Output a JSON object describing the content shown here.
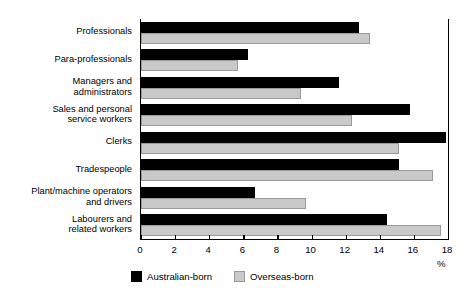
{
  "chart_data": {
    "type": "bar",
    "orientation": "horizontal",
    "title": "",
    "xlabel": "%",
    "ylabel": "",
    "xlim": [
      0,
      18
    ],
    "xticks": [
      0,
      2,
      4,
      6,
      8,
      10,
      12,
      14,
      16,
      18
    ],
    "grid": false,
    "legend_position": "bottom-center",
    "categories": [
      "Professionals",
      "Para-professionals",
      "Managers and\nadministrators",
      "Sales and personal\nservice workers",
      "Clerks",
      "Tradespeople",
      "Plant/machine operators\nand drivers",
      "Labourers and\nrelated workers"
    ],
    "series": [
      {
        "name": "Australian-born",
        "color": "#000000",
        "values": [
          12.8,
          6.3,
          11.6,
          15.8,
          17.9,
          15.1,
          6.7,
          14.4
        ]
      },
      {
        "name": "Overseas-born",
        "color": "#c9c9c9",
        "values": [
          13.4,
          5.7,
          9.4,
          12.4,
          15.1,
          17.1,
          9.7,
          17.6
        ]
      }
    ]
  },
  "legend": {
    "items": [
      {
        "label": "Australian-born",
        "swatch": "black"
      },
      {
        "label": "Overseas-born",
        "swatch": "grey"
      }
    ]
  },
  "axis": {
    "unit_label": "%"
  }
}
